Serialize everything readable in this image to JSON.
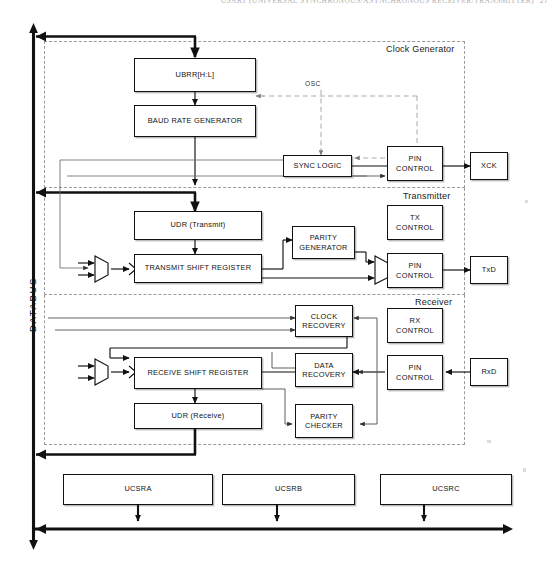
{
  "page": {
    "header_text": "USART (UNIVERSAL SYNCHRONOUS/ASYNCHRONOUS RECEIVER/TRANSMITTER)",
    "page_number": "27"
  },
  "bus": {
    "label": "DATABUS"
  },
  "sections": [
    {
      "id": "clock-generator",
      "label": "Clock Generator"
    },
    {
      "id": "transmitter",
      "label": "Transmitter"
    },
    {
      "id": "receiver",
      "label": "Receiver"
    }
  ],
  "signals": {
    "osc": "OSC"
  },
  "blocks": {
    "ubrr": {
      "label": "UBRR[H:L]"
    },
    "baud_rate_gen": {
      "label": "BAUD RATE GENERATOR"
    },
    "sync_logic": {
      "label": "SYNC LOGIC"
    },
    "clk_pin_control": {
      "line1": "PIN",
      "line2": "CONTROL"
    },
    "xck": {
      "label": "XCK"
    },
    "udr_transmit": {
      "label": "UDR (Transmit)"
    },
    "transmit_shift": {
      "label": "TRANSMIT SHIFT REGISTER"
    },
    "parity_generator": {
      "line1": "PARITY",
      "line2": "GENERATOR"
    },
    "tx_control": {
      "line1": "TX",
      "line2": "CONTROL"
    },
    "tx_pin_control": {
      "line1": "PIN",
      "line2": "CONTROL"
    },
    "txd": {
      "label": "TxD"
    },
    "clock_recovery": {
      "line1": "CLOCK",
      "line2": "RECOVERY"
    },
    "data_recovery": {
      "line1": "DATA",
      "line2": "RECOVERY"
    },
    "parity_checker": {
      "line1": "PARITY",
      "line2": "CHECKER"
    },
    "receive_shift": {
      "label": "RECEIVE SHIFT REGISTER"
    },
    "udr_receive": {
      "label": "UDR (Receive)"
    },
    "rx_control": {
      "line1": "RX",
      "line2": "CONTROL"
    },
    "rx_pin_control": {
      "line1": "PIN",
      "line2": "CONTROL"
    },
    "rxd": {
      "label": "RxD"
    }
  },
  "registers": [
    {
      "id": "ucsra",
      "label": "UCSRA"
    },
    {
      "id": "ucsrb",
      "label": "UCSRB"
    },
    {
      "id": "ucsrc",
      "label": "UCSRC"
    }
  ],
  "colors": {
    "ink": "#111111",
    "dashed_frame": "#9a9a9a",
    "thin_line": "#555555",
    "paper": "#ffffff"
  }
}
